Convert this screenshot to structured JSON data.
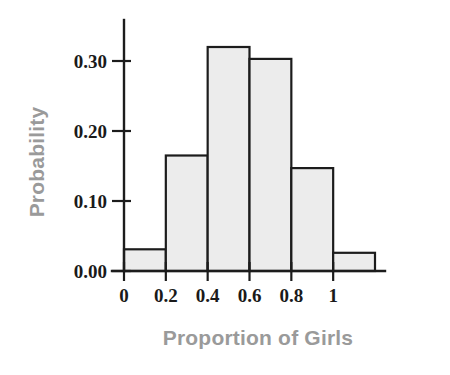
{
  "chart_data": {
    "type": "bar",
    "title": "",
    "subtitle": "",
    "xlabel": "Proportion of Girls",
    "ylabel": "Probability",
    "bin_edges": [
      0,
      0.2,
      0.4,
      0.6,
      0.8,
      1.0,
      1.2
    ],
    "categories": [
      "0-0.2",
      "0.2-0.4",
      "0.4-0.6",
      "0.6-0.8",
      "0.8-1.0",
      "1.0-1.2"
    ],
    "values": [
      0.031,
      0.165,
      0.32,
      0.303,
      0.147,
      0.026
    ],
    "xlim": [
      0,
      1.2
    ],
    "ylim": [
      0,
      0.345
    ],
    "x_tick_labels": [
      "0",
      "0.2",
      "0.4",
      "0.6",
      "0.8",
      "1"
    ],
    "x_tick_values": [
      0,
      0.2,
      0.4,
      0.6,
      0.8,
      1.0
    ],
    "y_tick_labels": [
      "0.00",
      "0.10",
      "0.20",
      "0.30"
    ],
    "y_tick_values": [
      0.0,
      0.1,
      0.2,
      0.3
    ],
    "grid": false,
    "legend": null,
    "legend_position": "none",
    "annotations": [],
    "colors": {
      "bar_fill": "#ececec",
      "bar_stroke": "#1c1c1c",
      "axis": "#1c1c1c",
      "tick_label": "#1a1a1a",
      "axis_title": "#9a9a9a",
      "background": "#ffffff"
    }
  }
}
